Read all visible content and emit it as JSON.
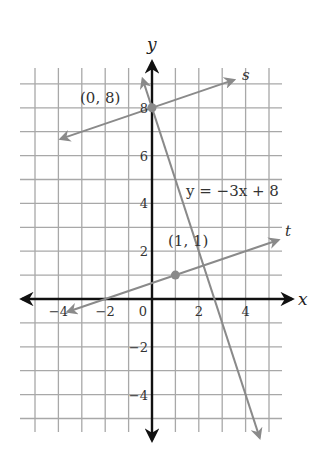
{
  "chart_data": {
    "type": "line",
    "title": "",
    "xlabel": "x",
    "ylabel": "y",
    "xlim": [
      -5,
      5.5
    ],
    "ylim": [
      -5.5,
      9
    ],
    "grid": true,
    "x_ticks": [
      -4,
      -2,
      0,
      2,
      4
    ],
    "y_ticks": [
      -4,
      -2,
      2,
      4,
      6,
      8
    ],
    "x_tick_labels": [
      "−4",
      "−2",
      "0",
      "2",
      "4"
    ],
    "y_tick_labels": [
      "−4",
      "−2",
      "2",
      "4",
      "6",
      "8"
    ],
    "series": [
      {
        "name": "s",
        "label": "s",
        "equation_slope": 0.3333,
        "equation_intercept": 8,
        "x_range": [
          -3.9,
          3.5
        ]
      },
      {
        "name": "t",
        "label": "t",
        "equation_slope": 0.3333,
        "equation_intercept": 0.6667,
        "x_range": [
          -3.6,
          5.4
        ]
      },
      {
        "name": "y = -3x + 8",
        "label": "y = −3x + 8",
        "equation_slope": -3,
        "equation_intercept": 8,
        "x_range": [
          -0.4,
          4.6
        ]
      }
    ],
    "points": [
      {
        "x": 0,
        "y": 8,
        "label": "(0, 8)"
      },
      {
        "x": 1,
        "y": 1,
        "label": "(1, 1)"
      }
    ],
    "annotations": {
      "line_equation": "y = −3x + 8",
      "s_label": "s",
      "t_label": "t",
      "point_a": "(0, 8)",
      "point_b": "(1, 1)"
    }
  }
}
